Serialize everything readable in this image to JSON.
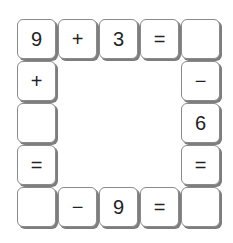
{
  "puzzle": {
    "tiles": [
      {
        "row": 0,
        "col": 0,
        "value": "9"
      },
      {
        "row": 0,
        "col": 1,
        "value": "+"
      },
      {
        "row": 0,
        "col": 2,
        "value": "3"
      },
      {
        "row": 0,
        "col": 3,
        "value": "="
      },
      {
        "row": 0,
        "col": 4,
        "value": ""
      },
      {
        "row": 1,
        "col": 0,
        "value": "+"
      },
      {
        "row": 1,
        "col": 4,
        "value": "−"
      },
      {
        "row": 2,
        "col": 0,
        "value": ""
      },
      {
        "row": 2,
        "col": 4,
        "value": "6"
      },
      {
        "row": 3,
        "col": 0,
        "value": "="
      },
      {
        "row": 3,
        "col": 4,
        "value": "="
      },
      {
        "row": 4,
        "col": 0,
        "value": ""
      },
      {
        "row": 4,
        "col": 1,
        "value": "−"
      },
      {
        "row": 4,
        "col": 2,
        "value": "9"
      },
      {
        "row": 4,
        "col": 3,
        "value": "="
      },
      {
        "row": 4,
        "col": 4,
        "value": ""
      }
    ]
  }
}
